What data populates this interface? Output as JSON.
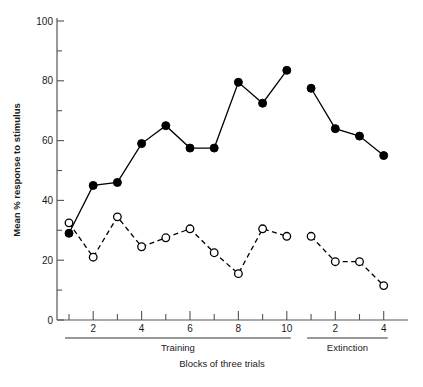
{
  "chart_data": {
    "type": "line",
    "title": "",
    "xlabel": "Blocks of three trials",
    "ylabel": "Mean % response to stimulus",
    "ylabel_bold_prefix": "Mean",
    "ylabel_rest": " % response to stimulus",
    "ylim": [
      0,
      100
    ],
    "y_ticks_major": [
      0,
      20,
      40,
      60,
      80,
      100
    ],
    "y_ticks_minor": [
      10,
      30,
      50,
      70,
      90
    ],
    "y_tick_labels": [
      "0",
      "20",
      "40",
      "60",
      "80",
      "100"
    ],
    "grid": false,
    "legend": "none",
    "phases": [
      {
        "name": "Training",
        "label": "Training",
        "categories": [
          1,
          2,
          3,
          4,
          5,
          6,
          7,
          8,
          9,
          10
        ],
        "tick_labels": [
          "",
          "2",
          "",
          "4",
          "",
          "6",
          "",
          "8",
          "",
          "10"
        ]
      },
      {
        "name": "Extinction",
        "label": "Extinction",
        "categories": [
          1,
          2,
          3,
          4
        ],
        "tick_labels": [
          "",
          "2",
          "",
          "4"
        ]
      }
    ],
    "series": [
      {
        "name": "filled-circle-series",
        "marker": "filled-circle",
        "line_style": "solid",
        "color": "#000000",
        "training_values": [
          29,
          45,
          46,
          59,
          65,
          57.5,
          57.5,
          79.5,
          72.5,
          83.5
        ],
        "extinction_values": [
          77.5,
          64,
          61.5,
          55
        ]
      },
      {
        "name": "open-circle-series",
        "marker": "open-circle",
        "line_style": "dashed",
        "color": "#000000",
        "training_values": [
          32.5,
          21,
          34.5,
          24.5,
          27.5,
          30.5,
          22.5,
          15.5,
          30.5,
          28
        ],
        "extinction_values": [
          28,
          19.5,
          19.5,
          11.5
        ]
      }
    ],
    "xlabel_caption": "Blocks of three trials"
  }
}
